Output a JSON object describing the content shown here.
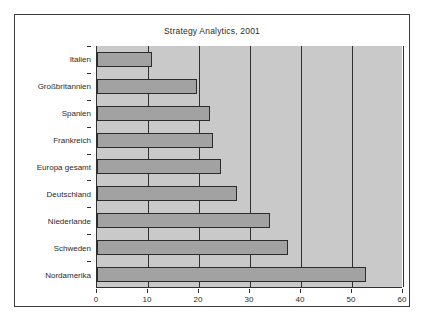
{
  "chart_data": {
    "type": "bar",
    "orientation": "horizontal",
    "title": "Strategy Analytics, 2001",
    "xlabel": "",
    "ylabel": "",
    "xlim": [
      0,
      60
    ],
    "xticks": [
      0,
      10,
      20,
      30,
      40,
      50,
      60
    ],
    "grid": "vertical-major",
    "legend": "none",
    "categories": [
      "Italien",
      "Großbritannien",
      "Spanien",
      "Frankreich",
      "Europa gesamt",
      "Deutschland",
      "Niederlande",
      "Schweden",
      "Nordamerika"
    ],
    "values": [
      10.8,
      19.7,
      22.2,
      22.8,
      24.3,
      27.4,
      34.0,
      37.5,
      52.7
    ],
    "colors": {
      "bar_fill": "#a2a2a2",
      "bar_border": "#2b2b2b",
      "plot_background": "#c9c9c9",
      "frame_background": "#ffffff",
      "frame_border": "#3c3c3c",
      "gridline": "#2f2f2f",
      "text": "#2b2b2b"
    }
  }
}
